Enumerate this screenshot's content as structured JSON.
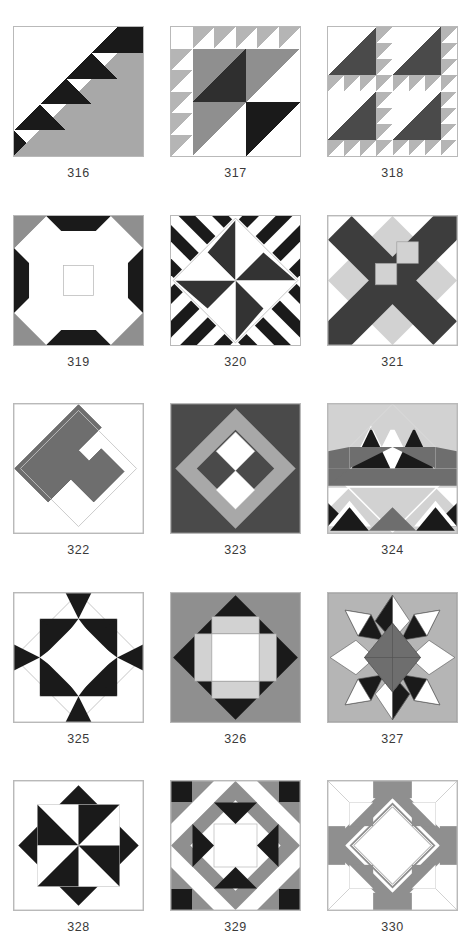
{
  "page": {
    "background": "#ffffff",
    "columns": 3,
    "rows": 5
  },
  "palette": {
    "white": "#ffffff",
    "black": "#1a1a1a",
    "dark_gray": "#4a4a4a",
    "mid_gray": "#6e6e6e",
    "gray": "#8f8f8f",
    "light_gray": "#b5b5b5",
    "pale_gray": "#d2d2d2",
    "outline": "#b9b9b9"
  },
  "blocks": [
    {
      "id": "316",
      "label": "316",
      "name": "diagonal-staircase",
      "description": "Black stair-step half-square triangles along the diagonal with a large gray triangle filling the lower right half.",
      "colors": [
        "#ffffff",
        "#1a1a1a",
        "#a8a8a8"
      ]
    },
    {
      "id": "317",
      "label": "317",
      "name": "sawtooth-corner-squares",
      "description": "Row of gray sawtooth triangles across the top and down the left side; four large center squares in dark gray, mid gray and black.",
      "colors": [
        "#ffffff",
        "#1a1a1a",
        "#4a4a4a",
        "#8f8f8f",
        "#b5b5b5"
      ]
    },
    {
      "id": "318",
      "label": "318",
      "name": "birds-in-the-air-four-patch",
      "description": "Two-by-two repeat of a large dark triangle unit bordered by small light gray triangles.",
      "colors": [
        "#ffffff",
        "#4a4a4a",
        "#b5b5b5"
      ]
    },
    {
      "id": "319",
      "label": "319",
      "name": "orange-peel-cross",
      "description": "Gray corner diamonds, black edge triangles and a white curved cross through the center.",
      "colors": [
        "#ffffff",
        "#1a1a1a",
        "#8f8f8f"
      ]
    },
    {
      "id": "320",
      "label": "320",
      "name": "four-point-star-with-stripes",
      "description": "Four pointed black star on white centered in a square of black and white diagonal stripes.",
      "colors": [
        "#ffffff",
        "#1a1a1a"
      ]
    },
    {
      "id": "321",
      "label": "321",
      "name": "dark-x-with-light-diamonds",
      "description": "Broad dark diagonal X crossing the block with pale gray diamonds on the axes and two pale center squares.",
      "colors": [
        "#ffffff",
        "#3d3d3d",
        "#d2d2d2"
      ]
    },
    {
      "id": "322",
      "label": "322",
      "name": "spiral-snail-trail",
      "description": "A single gray spiral / hooked band set on point over a plain white square.",
      "colors": [
        "#ffffff",
        "#6e6e6e"
      ]
    },
    {
      "id": "323",
      "label": "323",
      "name": "diamond-in-a-square-four-patch",
      "description": "Dark gray ground, light gray on-point ring and a white / dark four-patch center.",
      "colors": [
        "#ffffff",
        "#4a4a4a",
        "#a8a8a8"
      ]
    },
    {
      "id": "324",
      "label": "324",
      "name": "basket-of-triangles",
      "description": "Pale gray ground with a dark gray band, white and black triangle peaks across the upper half.",
      "colors": [
        "#ffffff",
        "#1a1a1a",
        "#6e6e6e",
        "#d2d2d2"
      ]
    },
    {
      "id": "325",
      "label": "325",
      "name": "sawtooth-diamond",
      "description": "Large white on-point diamond framed by rows of black sawtooth triangles.",
      "colors": [
        "#ffffff",
        "#1a1a1a"
      ]
    },
    {
      "id": "326",
      "label": "326",
      "name": "square-in-a-diamond",
      "description": "Mid gray ground, black on-point diamond, pale gray cross and a white center square.",
      "colors": [
        "#ffffff",
        "#1a1a1a",
        "#8f8f8f",
        "#d2d2d2"
      ]
    },
    {
      "id": "327",
      "label": "327",
      "name": "eight-point-lemoyne-star",
      "description": "Eight pointed star with alternating black and white outer points and a dark gray pinwheel star in the middle.",
      "colors": [
        "#ffffff",
        "#1a1a1a",
        "#6e6e6e",
        "#b5b5b5"
      ]
    },
    {
      "id": "328",
      "label": "328",
      "name": "black-pinwheel-on-point",
      "description": "Black pinwheel with four blades over an on-point black square, white background.",
      "colors": [
        "#ffffff",
        "#1a1a1a"
      ]
    },
    {
      "id": "329",
      "label": "329",
      "name": "star-within-a-star",
      "description": "Black corner squares, gray diagonal sashing, black inward pointing triangles and a white center square.",
      "colors": [
        "#ffffff",
        "#1a1a1a",
        "#8f8f8f"
      ]
    },
    {
      "id": "330",
      "label": "330",
      "name": "gray-diamond-ring",
      "description": "Gray and white pieced frame surrounding a large white on-point diamond.",
      "colors": [
        "#ffffff",
        "#8f8f8f"
      ]
    }
  ]
}
